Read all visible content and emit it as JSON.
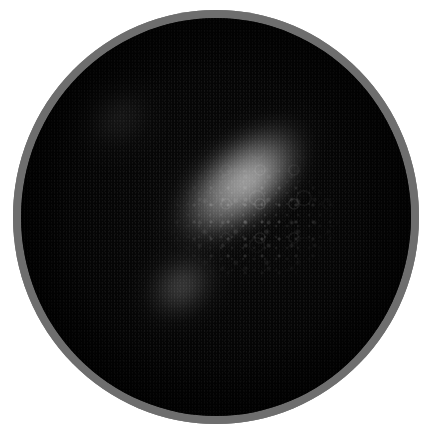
{
  "image": {
    "kind": "circular-specimen-photograph",
    "subject": "bacterial streak on a dark circular culture dish",
    "background_color": "#ffffff",
    "alt_text": "Dark circular dish with a gray rim; a pale granular diagonal streak of growth runs from lower-left to upper-right, with a faint secondary patch at upper-left.",
    "width_px": 430,
    "height_px": 435
  },
  "dish": {
    "name": "culture-dish",
    "rim_color": "#6e6e6e",
    "rim_inner_shadow_color": "#4a4a4a",
    "interior_color": "#050505",
    "rim_thickness_px": 8,
    "diameter_px": 406,
    "center_x_px": 216,
    "center_y_px": 217
  },
  "features": {
    "primary_streak": {
      "name": "primary-growth-streak",
      "description": "elongated diagonal band of pale granular growth",
      "orientation_deg": -42,
      "peak_gray": "#9a9a9a",
      "start_point": "190,330",
      "end_point": "355,175"
    },
    "streak_core": {
      "name": "streak-bright-core",
      "description": "brightest confluent center of the streak",
      "peak_gray": "#c8c8c8"
    },
    "streak_tail": {
      "name": "streak-lower-tail",
      "description": "dimmer lower-left continuation of the streak",
      "peak_gray": "#8c8c8c"
    },
    "secondary_patch": {
      "name": "secondary-faint-patch",
      "description": "faint textured haze in the upper-left quadrant",
      "peak_gray": "#606060",
      "center_point": "95,110"
    },
    "colony_texture": {
      "name": "colony-granular-texture",
      "description": "fine speckled and ring-shaped colony detail across the streak"
    },
    "grain": {
      "name": "sensor-grain",
      "description": "low-level luminance noise over the entire dark field"
    },
    "vignette": {
      "name": "edge-vignette",
      "description": "progressive darkening toward the dish rim"
    }
  }
}
